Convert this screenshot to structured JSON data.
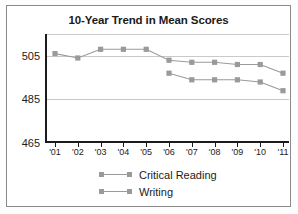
{
  "chart_data": {
    "type": "line",
    "title": "10-Year Trend in Mean Scores",
    "xlabel": "",
    "ylabel": "",
    "categories": [
      "'01",
      "'02",
      "'03",
      "'04",
      "'05",
      "'06",
      "'07",
      "'08",
      "'09",
      "'10",
      "'11"
    ],
    "ylim": [
      465,
      515
    ],
    "yticks": [
      465,
      485,
      505
    ],
    "ytick_labels": [
      "465",
      "485",
      "505"
    ],
    "gridlines": [
      485,
      505,
      515
    ],
    "grid": true,
    "legend_position": "bottom-center",
    "series": [
      {
        "name": "Critical Reading",
        "color": "#9a9a9a",
        "values": [
          506,
          504,
          508,
          508,
          508,
          503,
          502,
          502,
          501,
          501,
          497
        ]
      },
      {
        "name": "Writing",
        "color": "#9a9a9a",
        "values": [
          null,
          null,
          null,
          null,
          null,
          497,
          494,
          494,
          494,
          493,
          489
        ]
      }
    ]
  },
  "legend": {
    "items": [
      {
        "label": "Critical Reading"
      },
      {
        "label": "Writing"
      }
    ]
  }
}
